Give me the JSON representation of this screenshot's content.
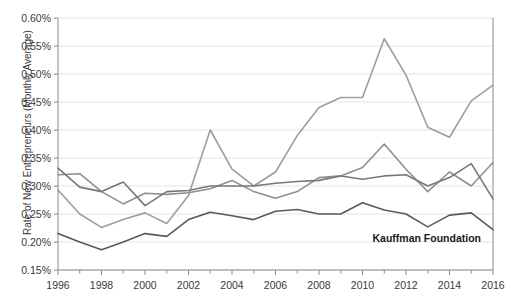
{
  "chart_data": {
    "type": "line",
    "title": "",
    "xlabel": "",
    "ylabel": "Rate of New Entrepreneurs (Monthly Average)",
    "annotation": "Kauffman Foundation",
    "grid": true,
    "legend_position": "none",
    "xlim": [
      1996,
      2016
    ],
    "ylim": [
      0.15,
      0.6
    ],
    "ytick_labels": [
      "0.15%",
      "0.20%",
      "0.25%",
      "0.30%",
      "0.35%",
      "0.40%",
      "0.45%",
      "0.50%",
      "0.55%",
      "0.60%"
    ],
    "ytick_values": [
      0.15,
      0.2,
      0.25,
      0.3,
      0.35,
      0.4,
      0.45,
      0.5,
      0.55,
      0.6
    ],
    "xtick_labels": [
      "1996",
      "1998",
      "2000",
      "2002",
      "2004",
      "2006",
      "2008",
      "2010",
      "2012",
      "2014",
      "2016"
    ],
    "xtick_values": [
      1996,
      1998,
      2000,
      2002,
      2004,
      2006,
      2008,
      2010,
      2012,
      2014,
      2016
    ],
    "x": [
      1996,
      1997,
      1998,
      1999,
      2000,
      2001,
      2002,
      2003,
      2004,
      2005,
      2006,
      2007,
      2008,
      2009,
      2010,
      2011,
      2012,
      2013,
      2014,
      2015,
      2016
    ],
    "series": [
      {
        "name": "series-rising",
        "color": "#9e9e9e",
        "values": [
          0.293,
          0.25,
          0.226,
          0.24,
          0.252,
          0.233,
          0.283,
          0.4,
          0.33,
          0.3,
          0.325,
          0.39,
          0.44,
          0.458,
          0.458,
          0.563,
          0.498,
          0.405,
          0.387,
          0.452,
          0.48
        ]
      },
      {
        "name": "series-upper",
        "color": "#8f8f8f",
        "values": [
          0.32,
          0.322,
          0.29,
          0.268,
          0.287,
          0.285,
          0.288,
          0.295,
          0.31,
          0.29,
          0.278,
          0.29,
          0.315,
          0.318,
          0.333,
          0.375,
          0.33,
          0.29,
          0.325,
          0.3,
          0.342
        ]
      },
      {
        "name": "series-mid",
        "color": "#777777",
        "values": [
          0.332,
          0.298,
          0.29,
          0.307,
          0.265,
          0.29,
          0.292,
          0.3,
          0.3,
          0.3,
          0.305,
          0.308,
          0.31,
          0.318,
          0.312,
          0.318,
          0.32,
          0.3,
          0.315,
          0.34,
          0.277
        ]
      },
      {
        "name": "series-lower",
        "color": "#5a5a5a",
        "values": [
          0.215,
          0.2,
          0.186,
          0.2,
          0.215,
          0.21,
          0.24,
          0.253,
          0.247,
          0.24,
          0.255,
          0.258,
          0.25,
          0.25,
          0.27,
          0.257,
          0.25,
          0.227,
          0.248,
          0.252,
          0.222
        ]
      }
    ]
  }
}
